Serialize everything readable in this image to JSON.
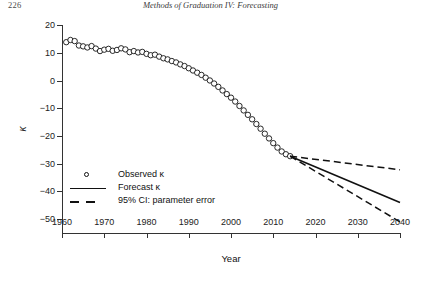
{
  "page": {
    "folio": "226",
    "running_title": "Methods of Graduation IV: Forecasting"
  },
  "axis": {
    "x_title": "Year",
    "y_title": "κ",
    "x_ticks": [
      "1960",
      "1970",
      "1980",
      "1990",
      "2000",
      "2010",
      "2020",
      "2030",
      "2040"
    ],
    "y_ticks": [
      "20",
      "10",
      "0",
      "−10",
      "−20",
      "−30",
      "−40",
      "−50"
    ]
  },
  "legend": {
    "items": [
      {
        "label": "Observed κ",
        "key": "circle-marker"
      },
      {
        "label": "Forecast κ",
        "key": "solid-line"
      },
      {
        "label": "95% CI: parameter error",
        "key": "dashed-line"
      }
    ]
  },
  "chart_data": {
    "type": "scatter",
    "title": "",
    "xlabel": "Year",
    "ylabel": "κ",
    "xlim": [
      1960,
      2040
    ],
    "ylim": [
      -55,
      20
    ],
    "grid": false,
    "legend_position": "lower-left-inside",
    "series": [
      {
        "name": "Observed κ",
        "style": "open-circle-markers",
        "x": [
          1961,
          1962,
          1963,
          1964,
          1965,
          1966,
          1967,
          1968,
          1969,
          1970,
          1971,
          1972,
          1973,
          1974,
          1975,
          1976,
          1977,
          1978,
          1979,
          1980,
          1981,
          1982,
          1983,
          1984,
          1985,
          1986,
          1987,
          1988,
          1989,
          1990,
          1991,
          1992,
          1993,
          1994,
          1995,
          1996,
          1997,
          1998,
          1999,
          2000,
          2001,
          2002,
          2003,
          2004,
          2005,
          2006,
          2007,
          2008,
          2009,
          2010,
          2011,
          2012,
          2013,
          2014
        ],
        "y": [
          13.8,
          14.6,
          14.2,
          12.6,
          12.3,
          11.9,
          12.4,
          11.5,
          10.6,
          11.1,
          11.4,
          10.7,
          11.0,
          11.6,
          11.2,
          10.2,
          10.6,
          10.1,
          10.3,
          9.6,
          9.1,
          9.3,
          8.6,
          8.0,
          7.6,
          7.0,
          6.5,
          5.8,
          5.2,
          4.4,
          3.6,
          2.8,
          2.0,
          1.0,
          0.0,
          -1.1,
          -2.3,
          -3.6,
          -4.9,
          -6.2,
          -7.6,
          -9.2,
          -10.8,
          -12.4,
          -14.0,
          -15.7,
          -17.4,
          -19.2,
          -20.9,
          -22.6,
          -24.2,
          -25.6,
          -26.6,
          -27.3
        ]
      },
      {
        "name": "Forecast κ",
        "style": "solid-line",
        "x": [
          2014,
          2040
        ],
        "y": [
          -27.3,
          -44.0
        ]
      },
      {
        "name": "95% CI upper",
        "style": "dashed-line",
        "x": [
          2014,
          2040
        ],
        "y": [
          -27.3,
          -32.2
        ]
      },
      {
        "name": "95% CI lower",
        "style": "dashed-line",
        "x": [
          2014,
          2040
        ],
        "y": [
          -27.3,
          -51.0
        ]
      }
    ]
  }
}
